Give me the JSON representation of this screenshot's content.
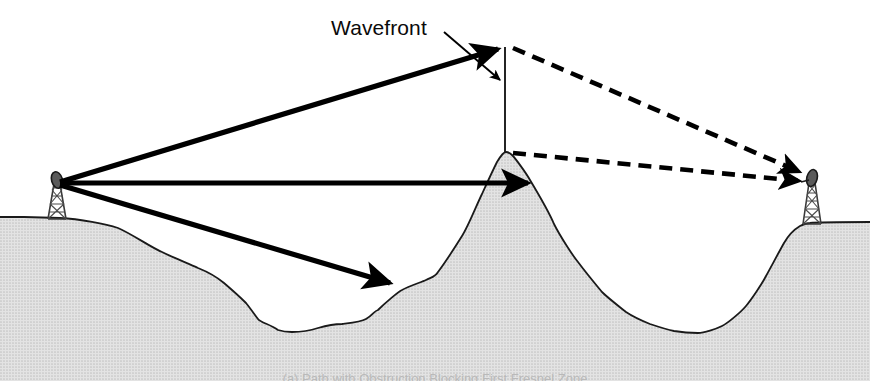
{
  "figure": {
    "width": 870,
    "height": 381,
    "background_color": "#ffffff"
  },
  "labels": {
    "wavefront": "Wavefront",
    "caption_partial": "(a) Path with Obstruction Blocking First Fresnel Zone"
  },
  "colors": {
    "terrain_fill": "#d8d8d8",
    "terrain_outline": "#1a1a1a",
    "ray_solid": "#000000",
    "ray_dashed": "#000000",
    "wavefront_line": "#1a1a1a",
    "tower_structure": "#3a3a3a",
    "text": "#0a0a0a"
  },
  "geometry": {
    "left_tower": {
      "base_x": 57,
      "base_y": 219,
      "top_y": 176,
      "antenna_x": 57,
      "antenna_y": 183
    },
    "right_tower": {
      "base_x": 812,
      "base_y": 224,
      "top_y": 173,
      "antenna_x": 812,
      "antenna_y": 180
    },
    "obstruction_peak": {
      "x": 505,
      "y": 152
    },
    "wavefront_apex": {
      "x": 505,
      "y": 47
    },
    "wavefront_line": {
      "x": 505,
      "y_top": 47,
      "y_bottom": 152
    },
    "left_valley_floor_y": 332,
    "right_valley_floor_y": 333,
    "left_plateau_y": 217,
    "right_plateau_y": 222,
    "ground_baseline_y": 355
  },
  "rays": {
    "solid": [
      {
        "name": "ray-to-wavefront-apex",
        "from_x": 57,
        "from_y": 183,
        "to_x": 505,
        "to_y": 47,
        "style": "solid",
        "arrowhead": true
      },
      {
        "name": "ray-horizontal-to-obstruction",
        "from_x": 57,
        "from_y": 183,
        "to_x": 534,
        "to_y": 183,
        "style": "solid",
        "arrowhead": true
      },
      {
        "name": "ray-diagonal-to-obstruction-flank",
        "from_x": 57,
        "from_y": 183,
        "to_x": 396,
        "to_y": 285,
        "style": "solid",
        "arrowhead": true
      }
    ],
    "dashed": [
      {
        "name": "diffracted-ray-from-apex",
        "from_x": 512,
        "from_y": 48,
        "to_x": 806,
        "to_y": 175,
        "style": "dashed",
        "arrowhead": true
      },
      {
        "name": "diffracted-ray-from-peak",
        "from_x": 512,
        "from_y": 153,
        "to_x": 806,
        "to_y": 182,
        "style": "dashed",
        "arrowhead": true
      }
    ],
    "leader": {
      "name": "wavefront-leader-arrow",
      "from_x": 444,
      "from_y": 32,
      "to_x": 500,
      "to_y": 82,
      "style": "thin-solid",
      "arrowhead": true
    }
  },
  "terrain_profile": {
    "description": "Ground cross-section: left plateau, descending stepped slope, valley, central mountain obstruction, right valley, right plateau",
    "points": [
      [
        0,
        217
      ],
      [
        24,
        217
      ],
      [
        60,
        218
      ],
      [
        96,
        221
      ],
      [
        118,
        228
      ],
      [
        140,
        240
      ],
      [
        162,
        252
      ],
      [
        182,
        262
      ],
      [
        198,
        268
      ],
      [
        212,
        274
      ],
      [
        224,
        283
      ],
      [
        236,
        294
      ],
      [
        246,
        303
      ],
      [
        252,
        311
      ],
      [
        258,
        319
      ],
      [
        266,
        325
      ],
      [
        278,
        330
      ],
      [
        292,
        332
      ],
      [
        306,
        331
      ],
      [
        318,
        328
      ],
      [
        330,
        325
      ],
      [
        342,
        324
      ],
      [
        354,
        323
      ],
      [
        366,
        319
      ],
      [
        378,
        310
      ],
      [
        390,
        299
      ],
      [
        402,
        290
      ],
      [
        414,
        284
      ],
      [
        426,
        280
      ],
      [
        438,
        272
      ],
      [
        450,
        256
      ],
      [
        462,
        236
      ],
      [
        472,
        216
      ],
      [
        482,
        194
      ],
      [
        490,
        176
      ],
      [
        497,
        162
      ],
      [
        502,
        154
      ],
      [
        506,
        152
      ],
      [
        512,
        155
      ],
      [
        520,
        164
      ],
      [
        530,
        180
      ],
      [
        542,
        202
      ],
      [
        554,
        224
      ],
      [
        566,
        244
      ],
      [
        578,
        262
      ],
      [
        590,
        278
      ],
      [
        602,
        292
      ],
      [
        614,
        303
      ],
      [
        626,
        312
      ],
      [
        638,
        319
      ],
      [
        650,
        324
      ],
      [
        662,
        328
      ],
      [
        674,
        331
      ],
      [
        686,
        333
      ],
      [
        698,
        333
      ],
      [
        710,
        331
      ],
      [
        722,
        326
      ],
      [
        734,
        318
      ],
      [
        746,
        306
      ],
      [
        756,
        292
      ],
      [
        766,
        276
      ],
      [
        776,
        258
      ],
      [
        784,
        243
      ],
      [
        792,
        232
      ],
      [
        800,
        226
      ],
      [
        810,
        223
      ],
      [
        826,
        222
      ],
      [
        848,
        222
      ],
      [
        870,
        222
      ]
    ]
  }
}
